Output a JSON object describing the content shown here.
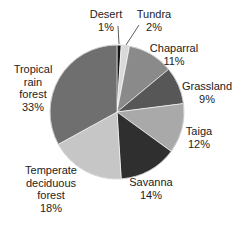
{
  "chart_data": {
    "type": "pie",
    "title": "",
    "start_angle_deg": 0,
    "direction": "clockwise",
    "categories": [
      "Desert",
      "Tundra",
      "Chaparral",
      "Grassland",
      "Taiga",
      "Savanna",
      "Temperate deciduous forest",
      "Tropical rain forest"
    ],
    "values": [
      1,
      2,
      11,
      9,
      12,
      14,
      18,
      33
    ],
    "unit": "%",
    "colors": [
      "#141414",
      "#d9d9d9",
      "#8a8a8a",
      "#575757",
      "#a9a9a9",
      "#2f2f2f",
      "#c6c6c6",
      "#6f6f6f"
    ]
  },
  "labels": [
    {
      "lines": [
        "Desert",
        "1%"
      ],
      "x": 106,
      "y": 8
    },
    {
      "lines": [
        "Tundra",
        "2%"
      ],
      "x": 154,
      "y": 8
    },
    {
      "lines": [
        "Chaparral",
        "11%"
      ],
      "x": 174,
      "y": 42
    },
    {
      "lines": [
        "Grassland",
        "9%"
      ],
      "x": 207,
      "y": 80
    },
    {
      "lines": [
        "Taiga",
        "12%"
      ],
      "x": 199,
      "y": 125
    },
    {
      "lines": [
        "Savanna",
        "14%"
      ],
      "x": 151,
      "y": 176
    },
    {
      "lines": [
        "Temperate",
        "deciduous",
        "forest",
        "18%"
      ],
      "x": 51,
      "y": 164
    },
    {
      "lines": [
        "Tropical",
        "rain",
        "forest",
        "33%"
      ],
      "x": 33,
      "y": 63
    }
  ],
  "leaders": [
    {
      "x1": 119,
      "y1": 44,
      "x2": 118,
      "y2": 26
    },
    {
      "x1": 126,
      "y1": 45,
      "x2": 139,
      "y2": 25
    }
  ],
  "geometry": {
    "cx": 117,
    "cy": 112,
    "r": 67
  }
}
